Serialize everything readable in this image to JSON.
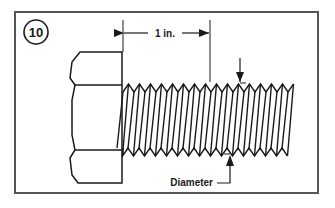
{
  "figure": {
    "number": "10",
    "dimension_length_label": "1 in.",
    "diameter_label": "Diameter",
    "thread_count_per_inch_shown": 8
  },
  "colors": {
    "background": "#ffffff",
    "frame": "#555555",
    "ink": "#1a1a1a"
  }
}
